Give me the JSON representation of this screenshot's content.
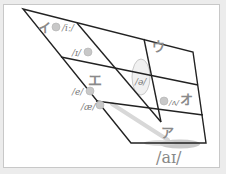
{
  "diagram": {
    "type": "vowel-trapezoid",
    "kana_labels": [
      {
        "id": "i",
        "text": "イ"
      },
      {
        "id": "u",
        "text": "ウ"
      },
      {
        "id": "e",
        "text": "エ"
      },
      {
        "id": "o",
        "text": "オ"
      },
      {
        "id": "a",
        "text": "ア"
      }
    ],
    "ipa_labels": [
      {
        "id": "i_long",
        "text": "/iː/"
      },
      {
        "id": "ih",
        "text": "/ɪ/"
      },
      {
        "id": "schwa",
        "text": "/ə/"
      },
      {
        "id": "e",
        "text": "/e/"
      },
      {
        "id": "ae",
        "text": "/æ/"
      },
      {
        "id": "wedge",
        "text": "/ʌ/"
      },
      {
        "id": "ai",
        "text": "/aɪ/"
      }
    ],
    "colors": {
      "lines": "#222222",
      "dots": "#c4c4c4",
      "text": "#888888",
      "frame_border": "#c8c8c8",
      "background": "#ffffff"
    }
  }
}
